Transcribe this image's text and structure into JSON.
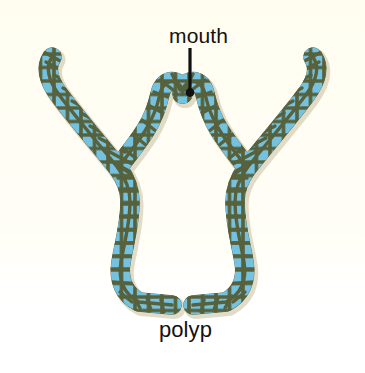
{
  "figure": {
    "subject": "polyp",
    "view": "longitudinal cross-section",
    "background_color": "#fffdf0",
    "page_color": "#ffffff"
  },
  "labels": {
    "mouth": "mouth",
    "polyp": "polyp"
  },
  "leader": {
    "name": "mouth-leader-line",
    "color": "#111111",
    "line": {
      "x1": 190,
      "y1": 48,
      "x2": 190,
      "y2": 92
    },
    "dot": {
      "cx": 190,
      "cy": 93,
      "r": 4.2
    }
  },
  "organism": {
    "name": "polyp-body",
    "cell_fill": "#74c2e0",
    "cell_outline": "#57613c",
    "shadow_color": "#cfc7ae",
    "wall_width": 19,
    "parts": [
      {
        "name": "left-tentacle",
        "description": "long outer tentacle extending to upper left"
      },
      {
        "name": "left-hypostome-lobe",
        "description": "short inner lobe curving up to the mouth"
      },
      {
        "name": "left-body-wall",
        "description": "left side of the stalk descending to the base"
      },
      {
        "name": "right-tentacle",
        "description": "long outer tentacle extending to upper right"
      },
      {
        "name": "right-hypostome-lobe",
        "description": "short inner lobe curving up to the mouth"
      },
      {
        "name": "right-body-wall",
        "description": "right side of the stalk descending to the base"
      },
      {
        "name": "mouth-opening",
        "description": "gap between the two hypostome lobes"
      },
      {
        "name": "gastrovascular-cavity",
        "description": "open interior between the two body walls"
      },
      {
        "name": "basal-opening",
        "description": "gap at the bottom of the stalk"
      }
    ]
  }
}
